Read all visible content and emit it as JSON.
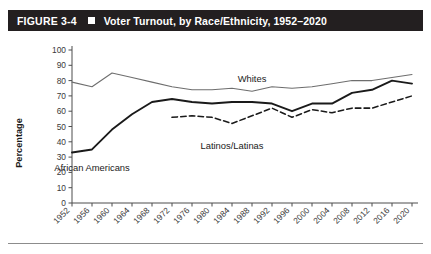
{
  "figure": {
    "number_label": "FIGURE 3-4",
    "square_marker": "filled-square",
    "title": "Voter Turnout, by Race/Ethnicity, 1952–2020"
  },
  "chart_data": {
    "type": "line",
    "title": "Voter Turnout, by Race/Ethnicity, 1952–2020",
    "xlabel": "",
    "ylabel": "Percentage",
    "xlim": [
      1952,
      2020
    ],
    "ylim": [
      0,
      100
    ],
    "grid": false,
    "legend": "inline-labels",
    "categories": [
      "1952",
      "1956",
      "1960",
      "1964",
      "1968",
      "1972",
      "1976",
      "1980",
      "1984",
      "1988",
      "1992",
      "1996",
      "2000",
      "2004",
      "2008",
      "2012",
      "2016",
      "2020"
    ],
    "yticks": [
      0,
      10,
      20,
      30,
      40,
      50,
      60,
      70,
      80,
      90,
      100
    ],
    "series": [
      {
        "name": "Whites",
        "style": "solid-thin",
        "color": "#6e6e6e",
        "label_x": "1988",
        "values": [
          79,
          76,
          85,
          82,
          79,
          76,
          74,
          74,
          75,
          73,
          76,
          75,
          76,
          78,
          80,
          80,
          82,
          84
        ]
      },
      {
        "name": "African Americans",
        "style": "solid-thick",
        "color": "#1a1a1a",
        "label_x": "1956",
        "values": [
          33,
          35,
          48,
          58,
          66,
          68,
          66,
          65,
          66,
          66,
          65,
          60,
          65,
          65,
          72,
          74,
          80,
          78
        ]
      },
      {
        "name": "Latinos/Latinas",
        "style": "dashed",
        "color": "#1a1a1a",
        "label_x": "1984",
        "values": [
          null,
          null,
          null,
          null,
          null,
          56,
          57,
          56,
          52,
          57,
          62,
          56,
          61,
          59,
          62,
          62,
          66,
          70
        ]
      }
    ]
  }
}
